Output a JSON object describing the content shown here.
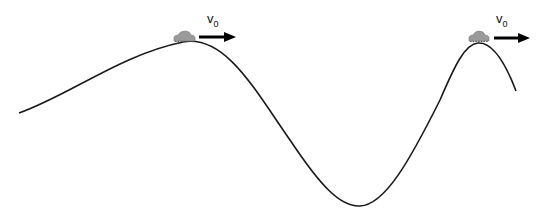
{
  "diagram": {
    "type": "roller-coaster track with two cars",
    "track": {
      "color": "#1a1a1a",
      "points": {
        "start": [
          19,
          113
        ],
        "peak1": [
          183,
          42
        ],
        "trough": [
          360,
          206
        ],
        "peak2": [
          478,
          43
        ],
        "end": [
          516,
          91
        ]
      }
    },
    "cars": [
      {
        "position": "first-peak",
        "color": "#9a9a9a",
        "velocity_label": {
          "main": "v",
          "sub": "0"
        }
      },
      {
        "position": "second-peak",
        "color": "#9a9a9a",
        "velocity_label": {
          "main": "v",
          "sub": "0"
        }
      }
    ],
    "arrow_color": "#000000"
  }
}
